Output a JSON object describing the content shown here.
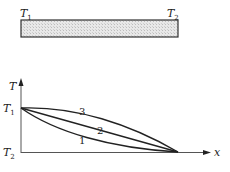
{
  "rod": {
    "left_label": "T",
    "left_sub": "1",
    "right_label": "T",
    "right_sub": "2",
    "fill_color": "#e4e4e4",
    "border_color": "#333333"
  },
  "graph": {
    "y_axis_label": "T",
    "x_axis_label": "x",
    "y_tick_top": {
      "label": "T",
      "sub": "1"
    },
    "y_tick_bottom": {
      "label": "T",
      "sub": "2"
    },
    "curves": [
      {
        "id": "1",
        "label": "1",
        "shape": "concave-up (below straight line)"
      },
      {
        "id": "2",
        "label": "2",
        "shape": "straight line"
      },
      {
        "id": "3",
        "label": "3",
        "shape": "concave-down (above straight line)"
      }
    ]
  }
}
